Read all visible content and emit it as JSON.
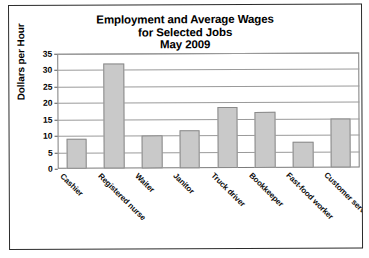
{
  "chart_data": {
    "type": "bar",
    "title": "Employment and Average Wages for Selected Jobs May 2009",
    "title_lines": [
      "Employment and Average Wages",
      "for Selected Jobs",
      "May 2009"
    ],
    "xlabel": "",
    "ylabel": "Dollars per Hour",
    "ylim": [
      0,
      35
    ],
    "ytick_step": 5,
    "yticks": [
      0,
      5,
      10,
      15,
      20,
      25,
      30,
      35
    ],
    "ytick_labels": [
      "0",
      "5",
      "10",
      "15",
      "20",
      "25",
      "30",
      "35"
    ],
    "grid": true,
    "legend": false,
    "categories": [
      "Cashier",
      "Registered nurse",
      "Waiter",
      "Janitor",
      "Truck driver",
      "Bookkeeper",
      "Fast-food worker",
      "Customer service rep"
    ],
    "values": [
      9,
      32,
      10,
      11.5,
      18.5,
      17,
      8,
      15
    ],
    "bar_color": "#c9c9c9",
    "bar_border_color": "#8a8a8a",
    "axis_color": "#7b7b7b",
    "grid_color": "#9a9a9a",
    "text_color": "#000000",
    "background": "#ffffff"
  }
}
